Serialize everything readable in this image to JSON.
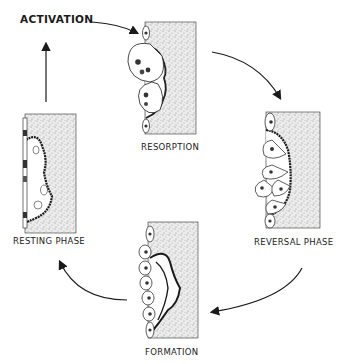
{
  "diagram": {
    "type": "cycle",
    "start_label": "ACTIVATION",
    "phases": [
      {
        "id": "resorption",
        "label": "RESORPTION"
      },
      {
        "id": "reversal",
        "label": "REVERSAL PHASE"
      },
      {
        "id": "formation",
        "label": "FORMATION"
      },
      {
        "id": "resting",
        "label": "RESTING PHASE"
      }
    ],
    "flow": [
      "ACTIVATION",
      "RESORPTION",
      "REVERSAL PHASE",
      "FORMATION",
      "RESTING PHASE",
      "ACTIVATION"
    ],
    "colors": {
      "ink": "#1a1a1a",
      "bone": "#e4e4e4",
      "background": "#ffffff"
    }
  }
}
